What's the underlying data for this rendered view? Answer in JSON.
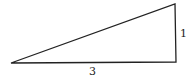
{
  "diagram": {
    "type": "right-triangle",
    "vertices": {
      "left": [
        11,
        63
      ],
      "bottom_right": [
        176,
        62
      ],
      "top_right": [
        175,
        4
      ]
    },
    "stroke_color": "#222222",
    "labels": {
      "base": "3",
      "height": "1"
    }
  }
}
